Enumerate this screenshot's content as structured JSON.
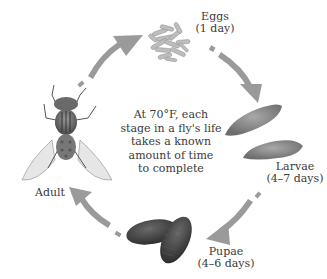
{
  "diagram": {
    "center_caption": [
      "At 70°F, each",
      "stage in a fly's life",
      "takes a known",
      "amount of time",
      "to complete"
    ],
    "stages": [
      {
        "name": "Eggs",
        "duration": "(1 day)"
      },
      {
        "name": "Larvae",
        "duration": "(4–7 days)"
      },
      {
        "name": "Pupae",
        "duration": "(4–6 days)"
      },
      {
        "name": "Adult",
        "duration": ""
      }
    ],
    "arrow_color": "#9a9a9a",
    "cycle_order": [
      "Eggs",
      "Larvae",
      "Pupae",
      "Adult",
      "Eggs"
    ]
  }
}
